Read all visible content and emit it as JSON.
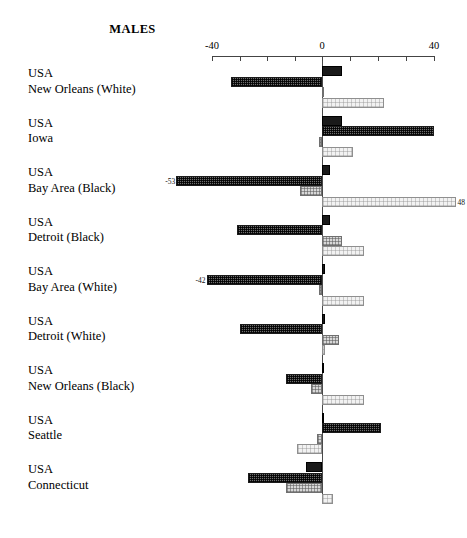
{
  "chart_data": {
    "type": "bar",
    "orientation": "horizontal",
    "title": "MALES",
    "xlabel": "",
    "ylabel": "",
    "xlim": [
      -40,
      40
    ],
    "tick_labels": [
      "-40",
      "0",
      "40"
    ],
    "tick_values": [
      -40,
      0,
      40
    ],
    "minor_ticks": [
      -30,
      -20,
      -10,
      10,
      20,
      30
    ],
    "grid": false,
    "legend": "none",
    "zero_reference_line": true,
    "series": [
      {
        "name": "series-1",
        "style": "black",
        "values": [
          7,
          7,
          3,
          3,
          1,
          1,
          0,
          0,
          -6
        ]
      },
      {
        "name": "series-2",
        "style": "dark-checker",
        "values": [
          -33,
          40,
          -53,
          -31,
          -42,
          -30,
          -13,
          21,
          -27
        ]
      },
      {
        "name": "series-3",
        "style": "mid-gray",
        "values": [
          0,
          -1,
          -8,
          7,
          -1,
          6,
          -4,
          -2,
          -13
        ]
      },
      {
        "name": "series-4",
        "style": "light-gray",
        "values": [
          22,
          11,
          48,
          15,
          15,
          1,
          15,
          -9,
          4
        ]
      }
    ],
    "categories": [
      {
        "country": "USA",
        "place": "New Orleans (White)"
      },
      {
        "country": "USA",
        "place": "Iowa"
      },
      {
        "country": "USA",
        "place": "Bay Area (Black)"
      },
      {
        "country": "USA",
        "place": "Detroit (Black)"
      },
      {
        "country": "USA",
        "place": "Bay Area (White)"
      },
      {
        "country": "USA",
        "place": "Detroit (White)"
      },
      {
        "country": "USA",
        "place": "New Orleans (Black)"
      },
      {
        "country": "USA",
        "place": "Seattle"
      },
      {
        "country": "USA",
        "place": "Connecticut"
      }
    ],
    "data_labels": [
      {
        "category_index": 2,
        "series_index": 1,
        "text": "-53",
        "side": "left"
      },
      {
        "category_index": 2,
        "series_index": 3,
        "text": "48",
        "side": "right"
      },
      {
        "category_index": 4,
        "series_index": 1,
        "text": "-42",
        "side": "left"
      }
    ],
    "colors": {
      "series_1": "#1a1a1a",
      "series_2": "#6d6d6d",
      "series_3": "#d8d8d8",
      "series_4": "#f2f2f2",
      "axis": "#444444",
      "text": "#000000",
      "background": "#ffffff"
    }
  }
}
